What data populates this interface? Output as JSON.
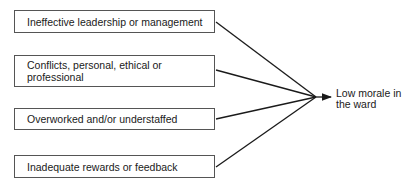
{
  "diagram": {
    "type": "cause-effect fan-in",
    "causes": [
      {
        "label": "Ineffective leadership or management"
      },
      {
        "label": "Conflicts, personal, ethical or professional"
      },
      {
        "label": "Overworked and/or understaffed"
      },
      {
        "label": "Inadequate rewards or feedback"
      }
    ],
    "outcome": {
      "label": "Low morale in the ward"
    },
    "colors": {
      "line": "#1a1a1a",
      "box_border": "#555555",
      "background": "#ffffff"
    }
  }
}
